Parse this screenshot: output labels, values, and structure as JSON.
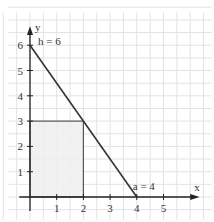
{
  "chart_data": {
    "type": "line",
    "title": "",
    "xlabel": "x",
    "ylabel": "y",
    "xlim": [
      -0.5,
      6.3
    ],
    "ylim": [
      -0.6,
      7.0
    ],
    "x_ticks": [
      1,
      2,
      3,
      4,
      5
    ],
    "y_ticks": [
      1,
      2,
      3,
      4,
      5,
      6
    ],
    "grid": true,
    "grid_step": 0.5,
    "series": [
      {
        "name": "triangle hypotenuse",
        "x": [
          0,
          4
        ],
        "y": [
          6,
          0
        ],
        "color": "#333333"
      }
    ],
    "shaded_rectangle": {
      "x": [
        0,
        2
      ],
      "y": [
        0,
        3
      ],
      "fill": "#eeeeee",
      "stroke": "#555555"
    },
    "annotations": [
      {
        "text": "h = 6",
        "x": 0.3,
        "y": 6.1
      },
      {
        "text": "a = 4",
        "x": 3.85,
        "y": 0.35
      }
    ]
  },
  "labels": {
    "x_axis": "x",
    "y_axis": "y",
    "h": "h = 6",
    "a": "a = 4"
  }
}
